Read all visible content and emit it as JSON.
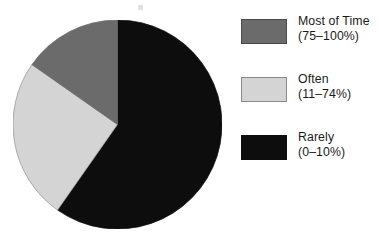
{
  "chart_data": {
    "type": "pie",
    "title": "",
    "subtitle": "",
    "xlabel": "",
    "ylabel": "",
    "grid": false,
    "legend_position": "right",
    "start_angle_deg": 0,
    "direction": "clockwise",
    "categories": [
      "Rarely",
      "Often",
      "Most of Time"
    ],
    "values": [
      60,
      25,
      15
    ],
    "units": "percent of responses",
    "slices": [
      {
        "label": "Rarely",
        "range_label": "(0–10%)",
        "value": 60,
        "start_deg": 0,
        "end_deg": 215,
        "sweep_deg": 215,
        "color": "#0d0d0d"
      },
      {
        "label": "Often",
        "range_label": "(11–74%)",
        "value": 25,
        "start_deg": 215,
        "end_deg": 305,
        "sweep_deg": 90,
        "color": "#d4d4d4"
      },
      {
        "label": "Most of Time",
        "range_label": "(75–100%)",
        "value": 15,
        "start_deg": 305,
        "end_deg": 360,
        "sweep_deg": 55,
        "color": "#6b6b6b"
      }
    ]
  },
  "legend": {
    "entries": [
      {
        "label": "Most of Time",
        "range": "(75–100%)",
        "color": "#6b6b6b",
        "border": "#4a4a4a"
      },
      {
        "label": "Often",
        "range": "(11–74%)",
        "color": "#d4d4d4",
        "border": "#8a8a8a"
      },
      {
        "label": "Rarely",
        "range": "(0–10%)",
        "color": "#0d0d0d",
        "border": "#0d0d0d"
      }
    ]
  },
  "colors": {
    "background": "#ffffff",
    "text": "#1a1a1a",
    "most_of_time": "#6b6b6b",
    "often": "#d4d4d4",
    "rarely": "#0d0d0d"
  }
}
